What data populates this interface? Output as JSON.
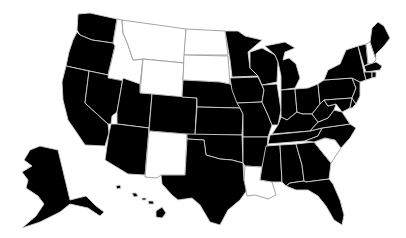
{
  "map": {
    "title": "United States",
    "colors": {
      "highlighted": "#000000",
      "not_highlighted": "#ffffff",
      "border": "#cfcfcf"
    },
    "not_highlighted_states": [
      "Idaho",
      "Montana",
      "Wyoming",
      "North Dakota",
      "South Dakota",
      "New Mexico",
      "Louisiana",
      "South Carolina",
      "New Hampshire"
    ],
    "highlighted_states": [
      "Washington",
      "Oregon",
      "California",
      "Nevada",
      "Utah",
      "Arizona",
      "Colorado",
      "Nebraska",
      "Kansas",
      "Oklahoma",
      "Texas",
      "Minnesota",
      "Iowa",
      "Missouri",
      "Arkansas",
      "Mississippi",
      "Alabama",
      "Georgia",
      "Florida",
      "Tennessee",
      "Kentucky",
      "Illinois",
      "Indiana",
      "Ohio",
      "Michigan",
      "Wisconsin",
      "West Virginia",
      "Virginia",
      "North Carolina",
      "Maryland",
      "Delaware",
      "Pennsylvania",
      "New Jersey",
      "New York",
      "Connecticut",
      "Rhode Island",
      "Massachusetts",
      "Vermont",
      "Maine",
      "Alaska",
      "Hawaii"
    ]
  }
}
